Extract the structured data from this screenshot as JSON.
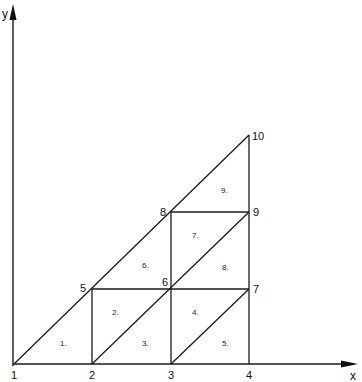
{
  "axes": {
    "x_label": "x",
    "y_label": "y"
  },
  "nodes": [
    {
      "id": "1",
      "label": "1"
    },
    {
      "id": "2",
      "label": "2"
    },
    {
      "id": "3",
      "label": "3"
    },
    {
      "id": "4",
      "label": "4"
    },
    {
      "id": "5",
      "label": "5"
    },
    {
      "id": "6",
      "label": "6"
    },
    {
      "id": "7",
      "label": "7"
    },
    {
      "id": "8",
      "label": "8"
    },
    {
      "id": "9",
      "label": "9"
    },
    {
      "id": "10",
      "label": "10"
    }
  ],
  "elements": [
    {
      "id": "1",
      "label": "1.",
      "nodes": [
        "1",
        "2",
        "5"
      ]
    },
    {
      "id": "2",
      "label": "2.",
      "nodes": [
        "2",
        "6",
        "5"
      ]
    },
    {
      "id": "3",
      "label": "3.",
      "nodes": [
        "2",
        "3",
        "6"
      ]
    },
    {
      "id": "4",
      "label": "4.",
      "nodes": [
        "3",
        "7",
        "6"
      ]
    },
    {
      "id": "5",
      "label": "5.",
      "nodes": [
        "3",
        "4",
        "7"
      ]
    },
    {
      "id": "6",
      "label": "6.",
      "nodes": [
        "5",
        "6",
        "8"
      ]
    },
    {
      "id": "7",
      "label": "7.",
      "nodes": [
        "6",
        "9",
        "8"
      ]
    },
    {
      "id": "8",
      "label": "8.",
      "nodes": [
        "6",
        "7",
        "9"
      ]
    },
    {
      "id": "9",
      "label": "9.",
      "nodes": [
        "8",
        "9",
        "10"
      ]
    }
  ]
}
